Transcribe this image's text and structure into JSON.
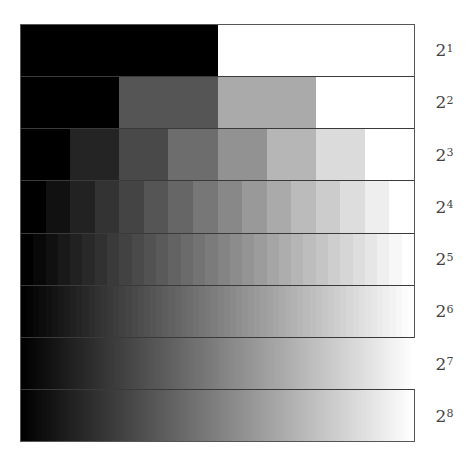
{
  "figure": {
    "frame_color": "#555555",
    "divider_color": "#3a3a3a"
  },
  "rows": [
    {
      "base": "2",
      "exponent": "1",
      "levels": 2
    },
    {
      "base": "2",
      "exponent": "2",
      "levels": 4
    },
    {
      "base": "2",
      "exponent": "3",
      "levels": 8
    },
    {
      "base": "2",
      "exponent": "4",
      "levels": 16
    },
    {
      "base": "2",
      "exponent": "5",
      "levels": 32
    },
    {
      "base": "2",
      "exponent": "6",
      "levels": 64
    },
    {
      "base": "2",
      "exponent": "7",
      "levels": 128
    },
    {
      "base": "2",
      "exponent": "8",
      "levels": 256
    }
  ]
}
